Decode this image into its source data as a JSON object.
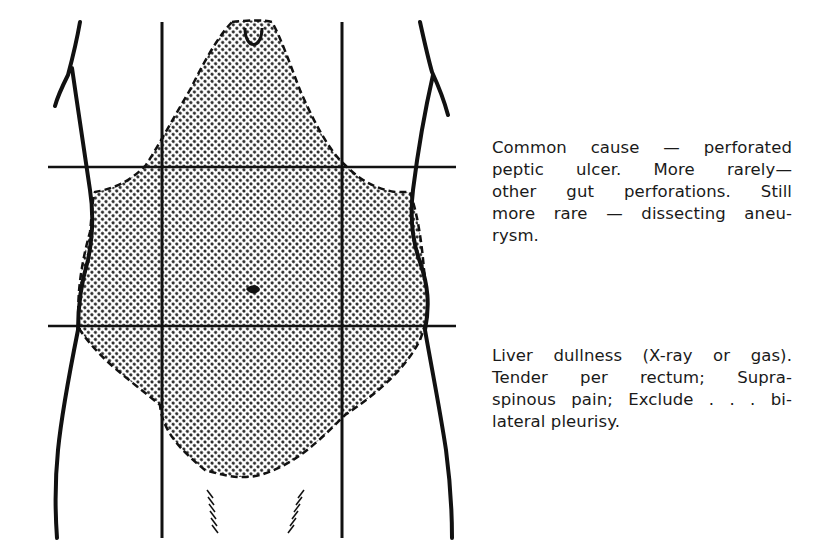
{
  "figure": {
    "shaded_region": "upper epigastric extending to whole abdomen",
    "colors": {
      "outline": "#111111",
      "pattern_dot": "#222222",
      "background": "#ffffff"
    }
  },
  "captions": [
    {
      "lines": [
        "Common cause — perforated",
        "peptic ulcer. More rarely—",
        "other gut perforations. Still",
        "more rare — dissecting aneu-",
        "rysm."
      ]
    },
    {
      "lines": [
        "Liver dullness (X-ray or gas).",
        "Tender per rectum; Supra-",
        "spinous pain; Exclude . . . bi-",
        "lateral pleurisy."
      ]
    }
  ]
}
